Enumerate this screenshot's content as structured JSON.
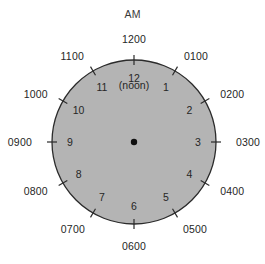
{
  "figure": {
    "title": "AM",
    "noon_label": "(noon)",
    "center_dot_name": "clock-center-dot"
  },
  "colors": {
    "dial_fill": "#b4b4b4",
    "dial_stroke": "#2b2b2b",
    "text": "#262626",
    "center_dot": "#101010",
    "background": "#ffffff"
  },
  "chart_data": {
    "type": "pie",
    "title": "AM",
    "xlabel": "",
    "ylabel": "",
    "subtitle": "(noon)",
    "grid": false,
    "legend": "none",
    "geometry": {
      "center_x": 134,
      "center_y": 142,
      "radius": 82,
      "tick_inner_offset": 5,
      "tick_outer_offset": 5,
      "inner_label_radius": 64,
      "outer_label_radius": 96
    },
    "categories": [
      "1200",
      "0100",
      "0200",
      "0300",
      "0400",
      "0500",
      "0600",
      "0700",
      "0800",
      "0900",
      "1000",
      "1100"
    ],
    "values": [
      30,
      30,
      30,
      30,
      30,
      30,
      30,
      30,
      30,
      30,
      30,
      30
    ],
    "hours": [
      {
        "inner": "12",
        "outer": "1200",
        "angle_deg": 0,
        "anchor": "middle",
        "dx": 0,
        "dy": -7
      },
      {
        "inner": "1",
        "outer": "0100",
        "angle_deg": 30,
        "anchor": "start",
        "dx": 2,
        "dy": -3
      },
      {
        "inner": "2",
        "outer": "0200",
        "angle_deg": 60,
        "anchor": "start",
        "dx": 3,
        "dy": 0
      },
      {
        "inner": "3",
        "outer": "0300",
        "angle_deg": 90,
        "anchor": "start",
        "dx": 6,
        "dy": 0
      },
      {
        "inner": "4",
        "outer": "0400",
        "angle_deg": 120,
        "anchor": "start",
        "dx": 3,
        "dy": 1
      },
      {
        "inner": "5",
        "outer": "0500",
        "angle_deg": 150,
        "anchor": "start",
        "dx": 1,
        "dy": 4
      },
      {
        "inner": "6",
        "outer": "0600",
        "angle_deg": 180,
        "anchor": "middle",
        "dx": 0,
        "dy": 8
      },
      {
        "inner": "7",
        "outer": "0700",
        "angle_deg": 210,
        "anchor": "end",
        "dx": -1,
        "dy": 4
      },
      {
        "inner": "8",
        "outer": "0800",
        "angle_deg": 240,
        "anchor": "end",
        "dx": -3,
        "dy": 1
      },
      {
        "inner": "9",
        "outer": "0900",
        "angle_deg": 270,
        "anchor": "end",
        "dx": -6,
        "dy": 0
      },
      {
        "inner": "10",
        "outer": "1000",
        "angle_deg": 300,
        "anchor": "end",
        "dx": -3,
        "dy": 0
      },
      {
        "inner": "11",
        "outer": "1100",
        "angle_deg": 330,
        "anchor": "end",
        "dx": -2,
        "dy": -3
      }
    ],
    "annotations": [
      {
        "text": "AM",
        "x": 134,
        "y": 14
      },
      {
        "text": "(noon)",
        "x": 134,
        "y": 85
      }
    ]
  }
}
